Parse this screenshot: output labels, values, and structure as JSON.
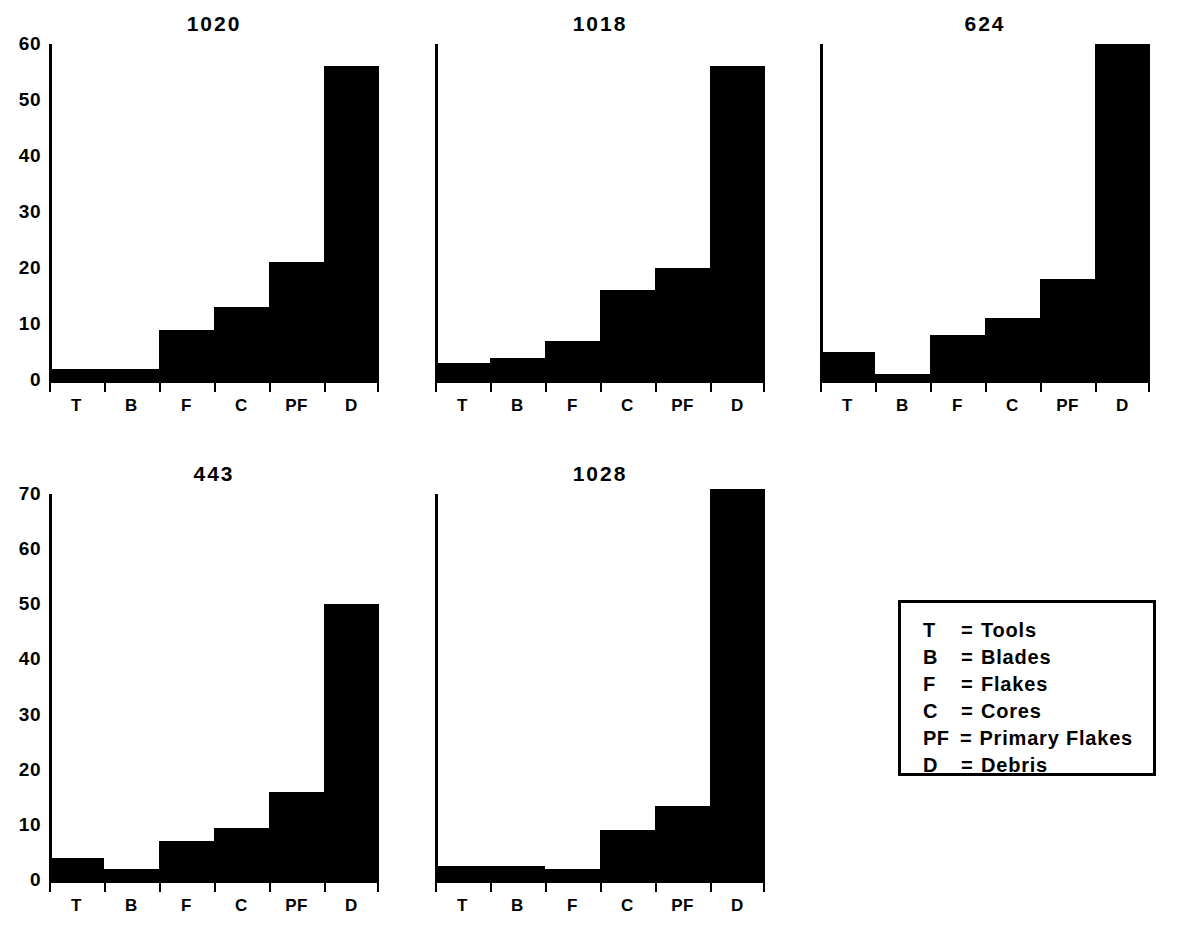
{
  "figure": {
    "background_color": "#ffffff",
    "ink_color": "#000000"
  },
  "legend": {
    "name": "artifact-class-key",
    "rows": [
      {
        "key": "T",
        "eq": "=",
        "value": "Tools"
      },
      {
        "key": "B",
        "eq": "=",
        "value": "Blades"
      },
      {
        "key": "F",
        "eq": "=",
        "value": "Flakes"
      },
      {
        "key": "C",
        "eq": "=",
        "value": "Cores"
      },
      {
        "key": "PF",
        "eq": "=",
        "value": "Primary Flakes"
      },
      {
        "key": "D",
        "eq": "=",
        "value": "Debris"
      }
    ]
  },
  "chart_data": [
    {
      "type": "bar",
      "title": "1020",
      "xlabel": "",
      "ylabel": "",
      "categories": [
        "T",
        "B",
        "F",
        "C",
        "PF",
        "D"
      ],
      "values": [
        2,
        2,
        9,
        13,
        21,
        56
      ],
      "ylim": [
        0,
        60
      ],
      "yticks": [
        0,
        10,
        20,
        30,
        40,
        50,
        60
      ],
      "ytick_labels": [
        "0",
        "10",
        "20",
        "30",
        "40",
        "50",
        "60"
      ],
      "grid": false,
      "legend": "none"
    },
    {
      "type": "bar",
      "title": "1018",
      "xlabel": "",
      "ylabel": "",
      "categories": [
        "T",
        "B",
        "F",
        "C",
        "PF",
        "D"
      ],
      "values": [
        3,
        4,
        7,
        16,
        20,
        56
      ],
      "ylim": [
        0,
        60
      ],
      "yticks": [
        0,
        10,
        20,
        30,
        40,
        50,
        60
      ],
      "ytick_labels": [
        "0",
        "10",
        "20",
        "30",
        "40",
        "50",
        "60"
      ],
      "grid": false,
      "legend": "none"
    },
    {
      "type": "bar",
      "title": "624",
      "xlabel": "",
      "ylabel": "",
      "categories": [
        "T",
        "B",
        "F",
        "C",
        "PF",
        "D"
      ],
      "values": [
        5,
        1,
        8,
        11,
        18,
        60
      ],
      "ylim": [
        0,
        60
      ],
      "yticks": [
        0,
        10,
        20,
        30,
        40,
        50,
        60
      ],
      "ytick_labels": [
        "0",
        "10",
        "20",
        "30",
        "40",
        "50",
        "60"
      ],
      "grid": false,
      "legend": "none"
    },
    {
      "type": "bar",
      "title": "443",
      "xlabel": "",
      "ylabel": "",
      "categories": [
        "T",
        "B",
        "F",
        "C",
        "PF",
        "D"
      ],
      "values": [
        4,
        2,
        7,
        9.5,
        16,
        50
      ],
      "ylim": [
        0,
        70
      ],
      "yticks": [
        0,
        10,
        20,
        30,
        40,
        50,
        60,
        70
      ],
      "ytick_labels": [
        "0",
        "10",
        "20",
        "30",
        "40",
        "50",
        "60",
        "70"
      ],
      "grid": false,
      "legend": "none"
    },
    {
      "type": "bar",
      "title": "1028",
      "xlabel": "",
      "ylabel": "",
      "categories": [
        "T",
        "B",
        "F",
        "C",
        "PF",
        "D"
      ],
      "values": [
        2.5,
        2.5,
        2,
        9,
        13.5,
        71
      ],
      "ylim": [
        0,
        70
      ],
      "yticks": [
        0,
        10,
        20,
        30,
        40,
        50,
        60,
        70
      ],
      "ytick_labels": [
        "0",
        "10",
        "20",
        "30",
        "40",
        "50",
        "60",
        "70"
      ],
      "grid": false,
      "legend": "none"
    }
  ],
  "layout": {
    "panels": [
      {
        "left": 49,
        "top": 44,
        "width": 330,
        "height": 336,
        "y_max": 60,
        "show_yaxis_labels": true
      },
      {
        "left": 435,
        "top": 44,
        "width": 330,
        "height": 336,
        "y_max": 60,
        "show_yaxis_labels": false
      },
      {
        "left": 820,
        "top": 44,
        "width": 330,
        "height": 336,
        "y_max": 60,
        "show_yaxis_labels": false
      },
      {
        "left": 49,
        "top": 494,
        "width": 330,
        "height": 386,
        "y_max": 70,
        "show_yaxis_labels": true
      },
      {
        "left": 435,
        "top": 494,
        "width": 330,
        "height": 386,
        "y_max": 70,
        "show_yaxis_labels": false
      }
    ],
    "legend_box": {
      "left": 898,
      "top": 600,
      "width": 258,
      "height": 176
    }
  }
}
